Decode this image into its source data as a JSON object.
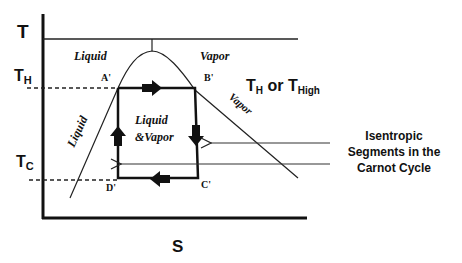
{
  "diagram": {
    "axes": {
      "y_label": "T",
      "x_label": "S",
      "t_high_label": "T",
      "t_high_sub": "H",
      "t_cold_label": "T",
      "t_cold_sub": "C"
    },
    "regions": {
      "liquid_top": "Liquid",
      "vapor_top": "Vapor",
      "liquid_line": "Liquid",
      "vapor_line": "Vapor",
      "mixture_line1": "Liquid",
      "mixture_line2": "&Vapor"
    },
    "points": {
      "a": "A'",
      "b": "B'",
      "c": "C'",
      "d": "D'"
    },
    "annotations": {
      "th_label_main1": "T",
      "th_label_sub1": "H",
      "th_label_or": " or ",
      "th_label_main2": "T",
      "th_label_sub2": "High",
      "isentropic_line1": "Isentropic",
      "isentropic_line2": "Segments in the",
      "isentropic_line3": "Carnot Cycle"
    },
    "colors": {
      "ink": "#111111",
      "background": "#ffffff"
    }
  }
}
